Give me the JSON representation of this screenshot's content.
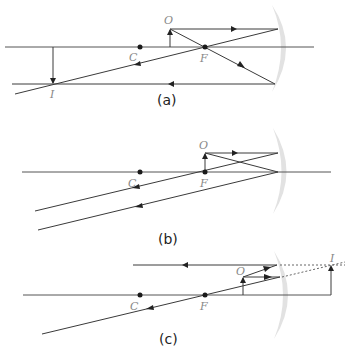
{
  "panels": [
    {
      "id": "a",
      "caption": "(a)",
      "labels": {
        "object": "O",
        "center": "C",
        "focus": "F",
        "image": "I"
      }
    },
    {
      "id": "b",
      "caption": "(b)",
      "labels": {
        "object": "O",
        "center": "C",
        "focus": "F"
      }
    },
    {
      "id": "c",
      "caption": "(c)",
      "labels": {
        "object": "O",
        "center": "C",
        "focus": "F",
        "image": "I"
      }
    }
  ]
}
